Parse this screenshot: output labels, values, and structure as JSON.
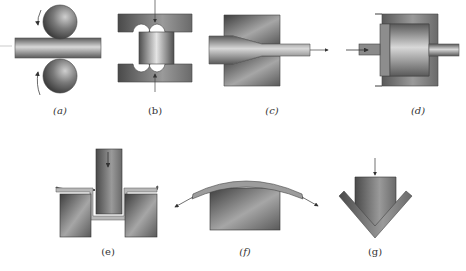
{
  "figure": {
    "panels": [
      {
        "id": "a",
        "label": "(a)",
        "process": "rolling"
      },
      {
        "id": "b",
        "label": "(b)",
        "process": "forging"
      },
      {
        "id": "c",
        "label": "(c)",
        "process": "drawing"
      },
      {
        "id": "d",
        "label": "(d)",
        "process": "extrusion"
      },
      {
        "id": "e",
        "label": "(e)",
        "process": "deep-drawing / punching"
      },
      {
        "id": "f",
        "label": "(f)",
        "process": "stretch-forming"
      },
      {
        "id": "g",
        "label": "(g)",
        "process": "bending"
      }
    ]
  },
  "colors": {
    "metal_dark": "#4a4a4a",
    "metal_mid": "#8a8a8a",
    "metal_light": "#e6e6e6",
    "outline": "#333333",
    "label": "#333333"
  }
}
